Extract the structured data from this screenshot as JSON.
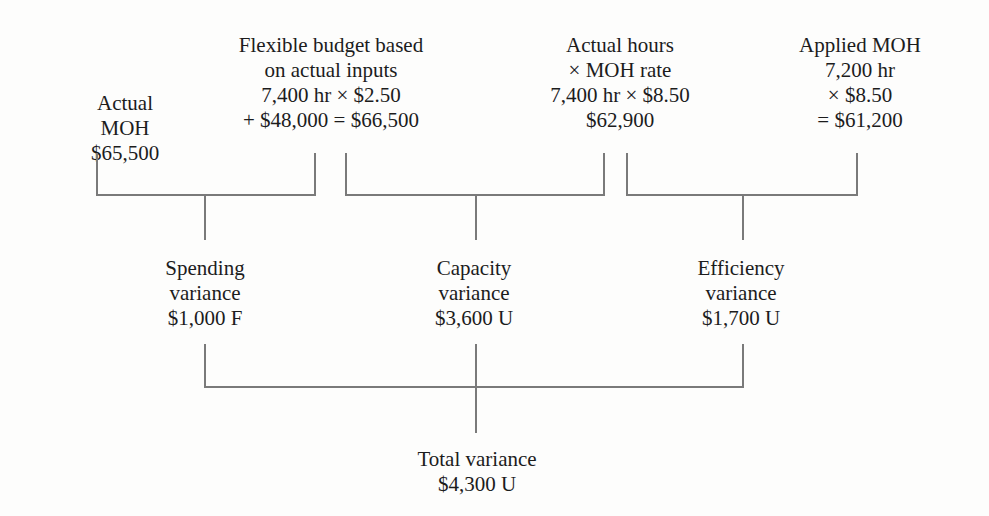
{
  "columns": [
    {
      "id": "actual_moh",
      "lines": [
        "Actual",
        "MOH",
        "$65,500"
      ]
    },
    {
      "id": "flexible_budget",
      "lines": [
        "Flexible budget based",
        "on actual inputs",
        "7,400 hr × $2.50",
        "+ $48,000 = $66,500"
      ]
    },
    {
      "id": "actual_hours_rate",
      "lines": [
        "Actual hours",
        "× MOH rate",
        "7,400 hr × $8.50",
        "$62,900"
      ]
    },
    {
      "id": "applied_moh",
      "lines": [
        "Applied MOH",
        "7,200 hr",
        "× $8.50",
        "= $61,200"
      ]
    }
  ],
  "variances": [
    {
      "id": "spending",
      "lines": [
        "Spending",
        "variance",
        "$1,000 F"
      ]
    },
    {
      "id": "capacity",
      "lines": [
        "Capacity",
        "variance",
        "$3,600 U"
      ]
    },
    {
      "id": "efficiency",
      "lines": [
        "Efficiency",
        "variance",
        "$1,700 U"
      ]
    }
  ],
  "total": {
    "lines": [
      "Total variance",
      "$4,300 U"
    ]
  },
  "colors": {
    "text": "#1c1c1c",
    "lines": "#7a7a7a",
    "background": "#fdfdfc"
  }
}
